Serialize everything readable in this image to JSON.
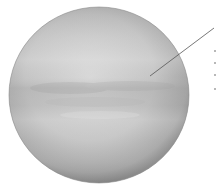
{
  "figure": {
    "style": "grayscale",
    "colors": {
      "limb": "#8a8a8a",
      "mid": "#b9b9b9",
      "highlight": "#dcdcdc",
      "band_dark": "#a6a6a6",
      "band_light": "#d4d4d4",
      "leader_line": "#555555"
    },
    "leader_line": {
      "x1": 150,
      "y1": 76,
      "x2": 214,
      "y2": 28
    },
    "label_ticks_y": [
      50,
      62,
      74,
      88
    ]
  }
}
